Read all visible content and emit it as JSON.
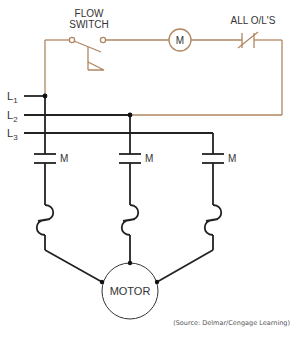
{
  "diagram": {
    "type": "ladder-wiring-diagram",
    "colors": {
      "control_circuit": "#b08660",
      "power_circuit": "#222222",
      "text": "#333333"
    },
    "control_circuit": {
      "flow_switch_label_line1": "FLOW",
      "flow_switch_label_line2": "SWITCH",
      "coil_label": "M",
      "overloads_label": "ALL O/L'S"
    },
    "lines": {
      "l1": {
        "base": "L",
        "sub": "1"
      },
      "l2": {
        "base": "L",
        "sub": "2"
      },
      "l3": {
        "base": "L",
        "sub": "3"
      }
    },
    "contacts": [
      {
        "label": "M"
      },
      {
        "label": "M"
      },
      {
        "label": "M"
      }
    ],
    "motor_label": "MOTOR",
    "source_credit": "(Source: Delmar/Cengage Learning)"
  }
}
